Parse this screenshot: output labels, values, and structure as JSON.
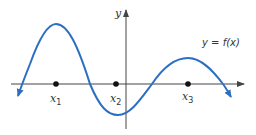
{
  "diagram": {
    "type": "function-graph",
    "function_label": "y = f(x)",
    "axes": {
      "x_label": "",
      "y_label": "y"
    },
    "points": [
      {
        "name": "x",
        "subscript": "1"
      },
      {
        "name": "x",
        "subscript": "2"
      },
      {
        "name": "x",
        "subscript": "3"
      }
    ],
    "colors": {
      "curve": "#2a6fc4",
      "axes": "#444444",
      "points": "#111111",
      "text": "#333333"
    }
  }
}
